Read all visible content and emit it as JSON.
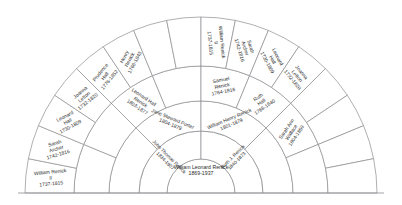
{
  "chart_data": {
    "type": "pie",
    "subtitle": "Pedigree of William Leonard Renick",
    "layout": {
      "shape": "semicircular-fan",
      "sweep_degrees": 180,
      "rings": 5,
      "ring_labels": [
        "center",
        "generation-1",
        "generation-2",
        "generation-3",
        "generation-4"
      ],
      "cells_per_ring": [
        1,
        2,
        4,
        8,
        16
      ],
      "grid": true,
      "legend": "none",
      "baseline": true
    },
    "center": {
      "name": "William Leonard Renick",
      "dates": "1869-1937",
      "ring": 0,
      "index": 0
    },
    "generation_1": [
      {
        "name": "John Thomas Renick",
        "dates": "1834-1907",
        "index": 0
      },
      {
        "name": "Ruth J. Renick",
        "dates": "1840-1873",
        "index": 1
      }
    ],
    "generation_2": [
      {
        "name": "Jane Steward Porter",
        "dates": "1804-1879",
        "index": 1
      },
      {
        "name": "William Henry Renick",
        "dates": "1801-1879",
        "index": 2
      }
    ],
    "generation_2_empty": [
      0,
      3
    ],
    "generation_3": [
      {
        "name": "Leonard Hall Renick",
        "dates": "1803-1877",
        "index": 2
      },
      {
        "name": "Samuel Renick",
        "dates": "1764-1816",
        "index": 4
      },
      {
        "name": "Ruth Hall",
        "dates": "1768-1840",
        "index": 5
      },
      {
        "name": "Sarah Ann Wallace",
        "dates": "1804-1859",
        "index": 6
      }
    ],
    "generation_3_empty": [
      0,
      1,
      3,
      7
    ],
    "generation_4": [
      {
        "name": "William Renick II",
        "dates": "1737-1815",
        "index": 0
      },
      {
        "name": "Sarah Archer",
        "dates": "1742-1816",
        "index": 1
      },
      {
        "name": "Leonard Hall",
        "dates": "1730-1809",
        "index": 2
      },
      {
        "name": "Joanna Letton",
        "dates": "1732-1820",
        "index": 3
      },
      {
        "name": "Prudence Hall",
        "dates": "1776-1852",
        "index": 4
      },
      {
        "name": "Henry Renick",
        "dates": "1766-1843",
        "index": 5
      },
      {
        "name": "William Renick II",
        "dates": "1737-1815",
        "index": 8
      },
      {
        "name": "Sarah Archer",
        "dates": "1742-1816",
        "index": 9
      },
      {
        "name": "Leonard Hall",
        "dates": "1730-1809",
        "index": 10
      },
      {
        "name": "Joanna Letton",
        "dates": "1732-1820",
        "index": 11
      }
    ],
    "generation_4_empty": [
      6,
      7,
      12,
      13,
      14,
      15
    ],
    "colors": {
      "background": "#ffffff",
      "stroke": "#8e8e92",
      "text": "#2b2b2b"
    }
  }
}
